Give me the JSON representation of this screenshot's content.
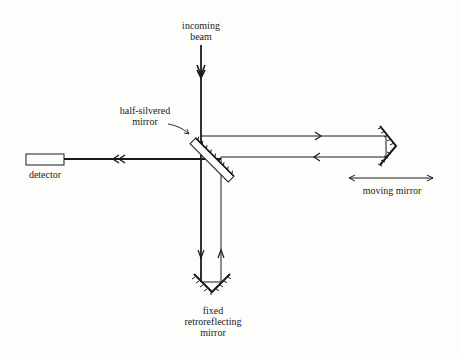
{
  "diagram": {
    "labels": {
      "incoming_beam": [
        "incoming",
        "beam"
      ],
      "half_silvered_mirror": [
        "half-silvered",
        "mirror"
      ],
      "detector": "detector",
      "moving_mirror": "moving mirror",
      "fixed_mirror": [
        "fixed",
        "retroreflecting",
        "mirror"
      ]
    },
    "colors": {
      "line": "#1a1a1a",
      "background": "#fdfdfc"
    }
  }
}
